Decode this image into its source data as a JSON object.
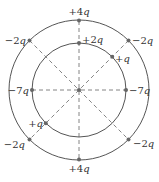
{
  "diagram": {
    "type": "concentric-circles-charge-arrangement",
    "center": {
      "x": 79,
      "y": 90
    },
    "outer_circle": {
      "radius": 70
    },
    "inner_circle": {
      "radius": 47
    },
    "colors": {
      "line": "#555555",
      "dash": "#777777",
      "dot": "#666666",
      "text": "#333333"
    },
    "outer_charges": [
      {
        "angle_deg": 90,
        "label": "+4q",
        "num": "+4",
        "var": "q"
      },
      {
        "angle_deg": 45,
        "label": "−2q",
        "num": "−2",
        "var": "q"
      },
      {
        "angle_deg": 135,
        "label": "−2q",
        "num": "−2",
        "var": "q"
      },
      {
        "angle_deg": 225,
        "label": "−2q",
        "num": "−2",
        "var": "q"
      },
      {
        "angle_deg": 315,
        "label": "−2q",
        "num": "−2",
        "var": "q"
      },
      {
        "angle_deg": 270,
        "label": "+4q",
        "num": "+4",
        "var": "q"
      }
    ],
    "inner_charges": [
      {
        "angle_deg": 90,
        "label": "+2q",
        "num": "+2",
        "var": "q"
      },
      {
        "angle_deg": 0,
        "label": "−7q",
        "num": "−7",
        "var": "q"
      },
      {
        "angle_deg": 180,
        "label": "−7q",
        "num": "−7",
        "var": "q"
      },
      {
        "angle_deg": 45,
        "label": "+q",
        "num": "+",
        "var": "q"
      },
      {
        "angle_deg": 225,
        "label": "+q",
        "num": "+",
        "var": "q"
      }
    ]
  }
}
